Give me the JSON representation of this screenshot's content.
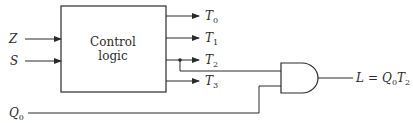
{
  "diagram": {
    "block": {
      "line1": "Control",
      "line2": "logic"
    },
    "inputs": [
      {
        "name": "Z",
        "sub": ""
      },
      {
        "name": "S",
        "sub": ""
      },
      {
        "name": "Q",
        "sub": "0"
      }
    ],
    "outputs": [
      {
        "name": "T",
        "sub": "0"
      },
      {
        "name": "T",
        "sub": "1"
      },
      {
        "name": "T",
        "sub": "2"
      },
      {
        "name": "T",
        "sub": "3"
      }
    ],
    "gate": {
      "type": "AND"
    },
    "result": {
      "lhs": "L",
      "eq": "=",
      "t1": "Q",
      "t1sub": "0",
      "t2": "T",
      "t2sub": "2"
    },
    "colors": {
      "line": "#2a2a2a",
      "background": "#ffffff"
    }
  }
}
